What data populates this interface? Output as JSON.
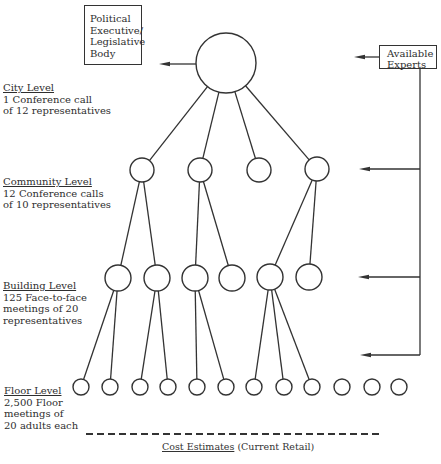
{
  "boxes": {
    "political": {
      "lines": [
        "Political",
        "Executive/",
        "Legislative",
        "Body"
      ]
    },
    "experts": {
      "lines": [
        "Available",
        "Experts"
      ]
    }
  },
  "levels": {
    "city": {
      "title": "City Level",
      "lines": [
        "1 Conference call",
        "of 12 representatives"
      ]
    },
    "community": {
      "title": "Community Level",
      "lines": [
        "12 Conference calls",
        "of 10 representatives"
      ]
    },
    "building": {
      "title": "Building Level",
      "lines": [
        "125 Face-to-face",
        "meetings of 20",
        "representatives"
      ]
    },
    "floor": {
      "title": "Floor Level",
      "lines": [
        "2,500 Floor",
        "meetings of",
        "20 adults each"
      ]
    }
  },
  "footer": {
    "underlined": "Cost Estimates",
    "rest": " (Current Retail)"
  },
  "colors": {
    "stroke": "#333333",
    "background": "#ffffff",
    "text": "#2e2e2e"
  },
  "tree": {
    "root": {
      "x": 226,
      "y": 63,
      "r": 30
    },
    "community": [
      {
        "x": 142,
        "y": 170,
        "r": 12,
        "children": [
          0,
          1
        ]
      },
      {
        "x": 200,
        "y": 170,
        "r": 12,
        "children": [
          2,
          3
        ]
      },
      {
        "x": 259,
        "y": 170,
        "r": 12,
        "children": []
      },
      {
        "x": 317,
        "y": 169,
        "r": 12,
        "children": [
          4,
          5
        ]
      }
    ],
    "building": [
      {
        "x": 118,
        "y": 278,
        "r": 13,
        "children": [
          0,
          1
        ]
      },
      {
        "x": 157,
        "y": 278,
        "r": 13,
        "children": [
          2,
          3
        ]
      },
      {
        "x": 195,
        "y": 278,
        "r": 13,
        "children": [
          4,
          5
        ]
      },
      {
        "x": 232,
        "y": 278,
        "r": 13,
        "children": []
      },
      {
        "x": 270,
        "y": 277,
        "r": 13,
        "children": [
          6,
          7,
          8
        ]
      },
      {
        "x": 309,
        "y": 277,
        "r": 13,
        "children": []
      }
    ],
    "floor": [
      {
        "x": 81,
        "y": 387,
        "r": 8
      },
      {
        "x": 110,
        "y": 387,
        "r": 8
      },
      {
        "x": 140,
        "y": 387,
        "r": 8
      },
      {
        "x": 168,
        "y": 387,
        "r": 8
      },
      {
        "x": 197,
        "y": 387,
        "r": 8
      },
      {
        "x": 226,
        "y": 387,
        "r": 8
      },
      {
        "x": 254,
        "y": 387,
        "r": 8
      },
      {
        "x": 284,
        "y": 387,
        "r": 8
      },
      {
        "x": 312,
        "y": 387,
        "r": 8
      },
      {
        "x": 342,
        "y": 387,
        "r": 8
      },
      {
        "x": 372,
        "y": 387,
        "r": 8
      },
      {
        "x": 399,
        "y": 387,
        "r": 8
      }
    ]
  },
  "arrows": {
    "root_to_political": {
      "x1": 196,
      "y": 64,
      "x2": 159
    },
    "experts_to_root": {
      "x1": 379,
      "y": 57,
      "x2": 354
    },
    "experts_bus": {
      "x": 420,
      "y1": 69,
      "y2": 355
    },
    "experts_to_levels": [
      {
        "y": 169,
        "x2": 359
      },
      {
        "y": 277,
        "x2": 358
      },
      {
        "y": 355,
        "x2": 360
      }
    ]
  },
  "dashed_line": {
    "x1": 86,
    "x2": 380,
    "y": 434
  }
}
